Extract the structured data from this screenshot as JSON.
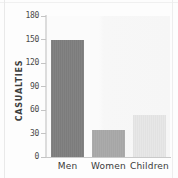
{
  "chart_data": {
    "type": "bar",
    "title": "",
    "subtitle": "",
    "xlabel": "",
    "ylabel": "CASUALTIES",
    "categories": [
      "Men",
      "Women",
      "Children"
    ],
    "values": [
      150,
      35,
      54
    ],
    "series": [
      {
        "name": "Casualties",
        "values": [
          150,
          35,
          54
        ]
      }
    ],
    "ylim": [
      0,
      180
    ],
    "yticks": [
      0,
      30,
      60,
      90,
      120,
      150,
      180
    ],
    "ytick_labels": [
      "0",
      "30",
      "60",
      "90",
      "120",
      "150",
      "180"
    ],
    "grid": false,
    "legend": null,
    "legend_position": "none",
    "bar_colors": [
      "#7c7c7c",
      "#a6a6a6",
      "#e7e7e7"
    ],
    "annotations": []
  },
  "axis": {
    "y_title": "CASUALTIES",
    "ticks": [
      {
        "label": "180",
        "value": 180
      },
      {
        "label": "150",
        "value": 150
      },
      {
        "label": "120",
        "value": 120
      },
      {
        "label": "90",
        "value": 90
      },
      {
        "label": "60",
        "value": 60
      },
      {
        "label": "30",
        "value": 30
      },
      {
        "label": "0",
        "value": 0
      }
    ]
  },
  "bars": [
    {
      "label": "Men",
      "value": 150,
      "color": "#7c7c7c"
    },
    {
      "label": "Women",
      "value": 35,
      "color": "#a6a6a6"
    },
    {
      "label": "Children",
      "value": 54,
      "color": "#e7e7e7"
    }
  ],
  "colors": {
    "page_background": "#fdfdfd",
    "plot_background": "#fbfbfb",
    "axis_line": "#dcdcdc",
    "tick_text": "#4a4a4a",
    "label_text": "#3a3a3a",
    "title_text": "#3e3e3e"
  }
}
